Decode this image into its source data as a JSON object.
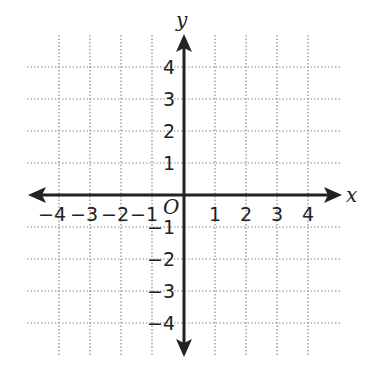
{
  "diagram": {
    "type": "coordinate-plane",
    "axes": {
      "x_label": "x",
      "y_label": "y",
      "origin_label": "O"
    },
    "x_tick_labels": [
      "−4",
      "−3",
      "−2",
      "−1",
      "1",
      "2",
      "3",
      "4"
    ],
    "y_tick_labels_pos": [
      "4",
      "3",
      "2",
      "1"
    ],
    "y_tick_labels_neg": [
      "−1",
      "−2",
      "−3",
      "−4"
    ],
    "range": {
      "x": [
        -4,
        4
      ],
      "y": [
        -4,
        4
      ]
    },
    "grid": "dotted",
    "colors": {
      "axis": "#222222",
      "grid": "#888888",
      "background": "#ffffff"
    }
  }
}
